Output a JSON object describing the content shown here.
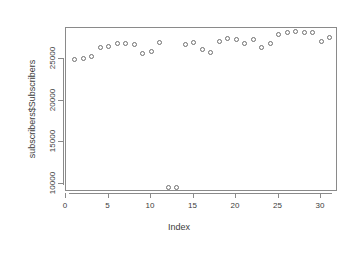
{
  "chart_data": {
    "type": "scatter",
    "title": "",
    "xlabel": "Index",
    "ylabel": "subscribers$Subscribers",
    "xlim": [
      0,
      32
    ],
    "ylim": [
      9000,
      28800
    ],
    "grid": false,
    "legend": null,
    "x_ticks": [
      0,
      5,
      10,
      15,
      20,
      25,
      30
    ],
    "x_tick_labels": [
      "0",
      "5",
      "10",
      "15",
      "20",
      "25",
      "30"
    ],
    "y_ticks": [
      10000,
      15000,
      20000,
      25000
    ],
    "y_tick_labels": [
      "10000",
      "15000",
      "20000",
      "25000"
    ],
    "point_symbol": "open-circle",
    "point_color": "#6f6f6f",
    "x": [
      1,
      2,
      3,
      4,
      5,
      6,
      7,
      8,
      9,
      10,
      11,
      12,
      13,
      14,
      15,
      16,
      17,
      18,
      19,
      20,
      21,
      22,
      23,
      24,
      25,
      26,
      27,
      28,
      29,
      30,
      31
    ],
    "y": [
      25000,
      25100,
      25400,
      26500,
      26600,
      26900,
      26900,
      26800,
      25700,
      26000,
      27100,
      9600,
      9600,
      26800,
      27100,
      26200,
      25900,
      27200,
      27500,
      27400,
      26900,
      27400,
      26500,
      26900,
      28000,
      28300,
      28400,
      28300,
      28200,
      27200,
      27600
    ]
  },
  "axes": {
    "x_title": "Index",
    "y_title": "subscribers$Subscribers"
  },
  "colors": {
    "frame": "#8a8a8a",
    "point": "#6f6f6f",
    "text": "#3c3c3c",
    "background": "#ffffff"
  }
}
